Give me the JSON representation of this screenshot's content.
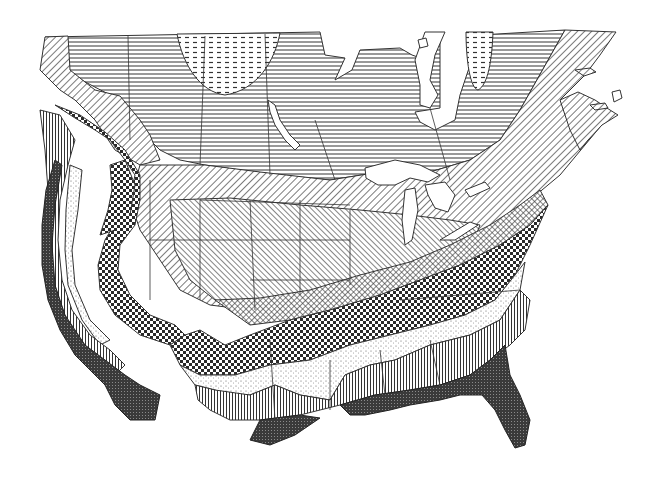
{
  "map": {
    "title": "",
    "width": 665,
    "height": 496,
    "background": "#ffffff",
    "ink": "#2a2a2a",
    "boundary_stroke": "#333333",
    "zones": [
      {
        "id": "zone-1",
        "name": "zone-1-arctic-dashed",
        "pattern": "dash"
      },
      {
        "id": "zone-2",
        "name": "zone-2-horizontal",
        "pattern": "horiz"
      },
      {
        "id": "zone-3",
        "name": "zone-3-diagonal-coarse",
        "pattern": "diag"
      },
      {
        "id": "zone-4",
        "name": "zone-4-diagonal-fine",
        "pattern": "diag2"
      },
      {
        "id": "zone-5",
        "name": "zone-5-crosshatch",
        "pattern": "cross"
      },
      {
        "id": "zone-6",
        "name": "zone-6-checkerboard",
        "pattern": "check"
      },
      {
        "id": "zone-7",
        "name": "zone-7-stipple",
        "pattern": "stip"
      },
      {
        "id": "zone-8",
        "name": "zone-8-vertical",
        "pattern": "vert"
      },
      {
        "id": "zone-9",
        "name": "zone-9-dense-grid",
        "pattern": "dense"
      }
    ]
  }
}
